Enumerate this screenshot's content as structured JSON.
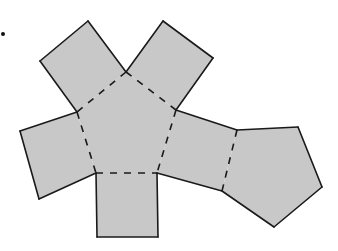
{
  "figure": {
    "fill_color": "#c8c8c8",
    "stroke_color": "#1a1a1a",
    "background_color": "#ffffff",
    "list_marker": "•",
    "shapes": [
      {
        "name": "central-pentagon",
        "type": "pentagon",
        "points": [
          [
            126,
            72
          ],
          [
            176,
            110
          ],
          [
            157,
            173
          ],
          [
            96,
            173
          ],
          [
            77,
            112
          ]
        ]
      },
      {
        "name": "top-left-square",
        "type": "square",
        "points": [
          [
            77,
            112
          ],
          [
            40,
            61
          ],
          [
            88,
            21
          ],
          [
            126,
            72
          ]
        ]
      },
      {
        "name": "top-right-square",
        "type": "square",
        "points": [
          [
            126,
            72
          ],
          [
            163,
            21
          ],
          [
            213,
            58
          ],
          [
            176,
            110
          ]
        ]
      },
      {
        "name": "left-square",
        "type": "square",
        "points": [
          [
            77,
            112
          ],
          [
            20,
            131
          ],
          [
            39,
            199
          ],
          [
            96,
            173
          ]
        ]
      },
      {
        "name": "bottom-square",
        "type": "square",
        "points": [
          [
            96,
            173
          ],
          [
            97,
            237
          ],
          [
            158,
            237
          ],
          [
            157,
            173
          ]
        ]
      },
      {
        "name": "right-rectangle",
        "type": "rectangle",
        "points": [
          [
            176,
            110
          ],
          [
            237,
            130
          ],
          [
            222,
            191
          ],
          [
            157,
            173
          ]
        ]
      },
      {
        "name": "right-pentagon",
        "type": "pentagon",
        "points": [
          [
            237,
            130
          ],
          [
            298,
            127
          ],
          [
            322,
            187
          ],
          [
            274,
            227
          ],
          [
            222,
            191
          ]
        ]
      }
    ],
    "fold_lines": [
      [
        [
          126,
          72
        ],
        [
          77,
          112
        ]
      ],
      [
        [
          126,
          72
        ],
        [
          176,
          110
        ]
      ],
      [
        [
          77,
          112
        ],
        [
          96,
          173
        ]
      ],
      [
        [
          96,
          173
        ],
        [
          157,
          173
        ]
      ],
      [
        [
          176,
          110
        ],
        [
          157,
          173
        ]
      ],
      [
        [
          237,
          130
        ],
        [
          222,
          191
        ]
      ]
    ]
  }
}
